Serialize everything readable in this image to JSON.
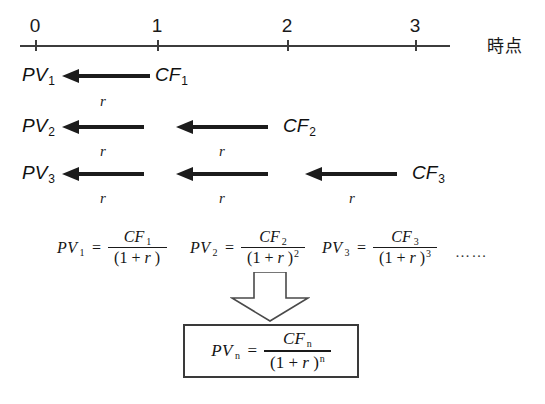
{
  "diagram": {
    "timeline": {
      "axis_label": "時点",
      "ticks": [
        {
          "label": "0",
          "x": 35
        },
        {
          "label": "1",
          "x": 157
        },
        {
          "label": "2",
          "x": 287
        },
        {
          "label": "3",
          "x": 415
        }
      ]
    },
    "rows": [
      {
        "pv_label": "PV",
        "pv_sub": "1",
        "cf_label": "CF",
        "cf_sub": "1",
        "rates": [
          "r"
        ]
      },
      {
        "pv_label": "PV",
        "pv_sub": "2",
        "cf_label": "CF",
        "cf_sub": "2",
        "rates": [
          "r",
          "r"
        ]
      },
      {
        "pv_label": "PV",
        "pv_sub": "3",
        "cf_label": "CF",
        "cf_sub": "3",
        "rates": [
          "r",
          "r",
          "r"
        ]
      }
    ],
    "formulas": [
      {
        "lhs": "PV",
        "lhs_sub": "1",
        "equals": "=",
        "numerator": "CF",
        "numerator_sub": "1",
        "denominator_open": "(1 + ",
        "denominator_var": "r",
        "denominator_close": " )",
        "denominator_exp": ""
      },
      {
        "lhs": "PV",
        "lhs_sub": "2",
        "equals": "=",
        "numerator": "CF",
        "numerator_sub": "2",
        "denominator_open": "(1 + ",
        "denominator_var": "r",
        "denominator_close": " )",
        "denominator_exp": "2"
      },
      {
        "lhs": "PV",
        "lhs_sub": "3",
        "equals": "=",
        "numerator": "CF",
        "numerator_sub": "3",
        "denominator_open": "(1 + ",
        "denominator_var": "r",
        "denominator_close": " )",
        "denominator_exp": "3"
      }
    ],
    "ellipsis": "……",
    "arrow_down": "down-arrow",
    "result": {
      "lhs": "PV",
      "lhs_sub": "n",
      "equals": "=",
      "numerator": "CF",
      "numerator_sub": "n",
      "denominator_open": "(1 + ",
      "denominator_var": "r",
      "denominator_close": " )",
      "denominator_exp": "n"
    }
  },
  "colors": {
    "ink": "#1a1a1a",
    "arrow": "#1c1c1c",
    "axis": "#3c3c3c",
    "box_border": "#3a3a3a",
    "background": "#ffffff"
  }
}
